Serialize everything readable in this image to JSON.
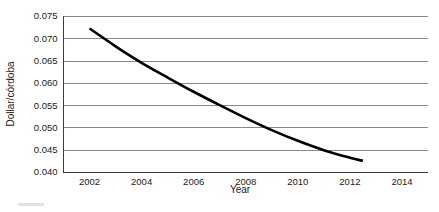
{
  "chart_data": {
    "type": "line",
    "title": "",
    "xlabel": "Year",
    "ylabel": "Dollar/córdoba",
    "xlim": [
      2001,
      2015
    ],
    "ylim": [
      0.04,
      0.075
    ],
    "grid": true,
    "legend": null,
    "xticks": [
      2002,
      2004,
      2006,
      2008,
      2010,
      2012,
      2014
    ],
    "xtick_labels": [
      "2002",
      "2004",
      "2006",
      "2008",
      "2010",
      "2012",
      "2014"
    ],
    "yticks": [
      0.04,
      0.045,
      0.05,
      0.055,
      0.06,
      0.065,
      0.07,
      0.075
    ],
    "ytick_labels": [
      "0.040",
      "0.045",
      "0.050",
      "0.055",
      "0.060",
      "0.065",
      "0.070",
      "0.075"
    ],
    "series": [
      {
        "name": "Dollar/córdoba exchange rate",
        "color": "#000000",
        "x": [
          2002.0,
          2003.0,
          2004.0,
          2005.0,
          2006.0,
          2007.0,
          2008.0,
          2009.0,
          2010.0,
          2011.0,
          2012.0,
          2012.5
        ],
        "values": [
          0.0722,
          0.0682,
          0.0645,
          0.0612,
          0.058,
          0.055,
          0.0521,
          0.0494,
          0.047,
          0.0449,
          0.0432,
          0.0425
        ]
      }
    ]
  },
  "axes": {
    "y_label": "Dollar/córdoba",
    "x_label": "Year"
  }
}
